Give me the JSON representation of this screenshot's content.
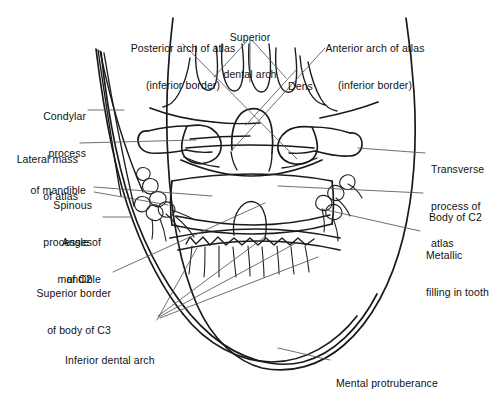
{
  "figure": {
    "background_color": "#ffffff",
    "line_color": "#1a1a1a",
    "leader_color": "#555555",
    "text_color": "#111111"
  },
  "labels": {
    "posterior_arch_atlas": {
      "line1": "Posterior arch of atlas",
      "line2": "(inferior border)"
    },
    "superior_dental_arch": {
      "line1": "Superior",
      "line2": "dental arch"
    },
    "anterior_arch_atlas": {
      "line1": "Anterior arch of atlas",
      "line2": "(inferior border)"
    },
    "dens": {
      "line1": "Dens"
    },
    "condylar_process": {
      "line1": "Condylar",
      "line2": "process",
      "line3": "of mandible"
    },
    "lateral_mass_atlas": {
      "line1": "Lateral mass",
      "line2": "of atlas"
    },
    "spinous_processes_c2": {
      "line1": "Spinous",
      "line2": "processes",
      "line3": "of C2"
    },
    "angle_of_mandible": {
      "line1": "Angle of",
      "line2": "mandible"
    },
    "superior_border_c3": {
      "line1": "Superior border",
      "line2": "of body of C3"
    },
    "inferior_dental_arch": {
      "line1": "Inferior dental arch"
    },
    "transverse_process_atlas": {
      "line1": "Transverse",
      "line2": "process of",
      "line3": "atlas"
    },
    "body_of_c2": {
      "line1": "Body of C2"
    },
    "metallic_filling": {
      "line1": "Metallic",
      "line2": "filling in tooth"
    },
    "mental_protuberance": {
      "line1": "Mental protruberance"
    }
  }
}
